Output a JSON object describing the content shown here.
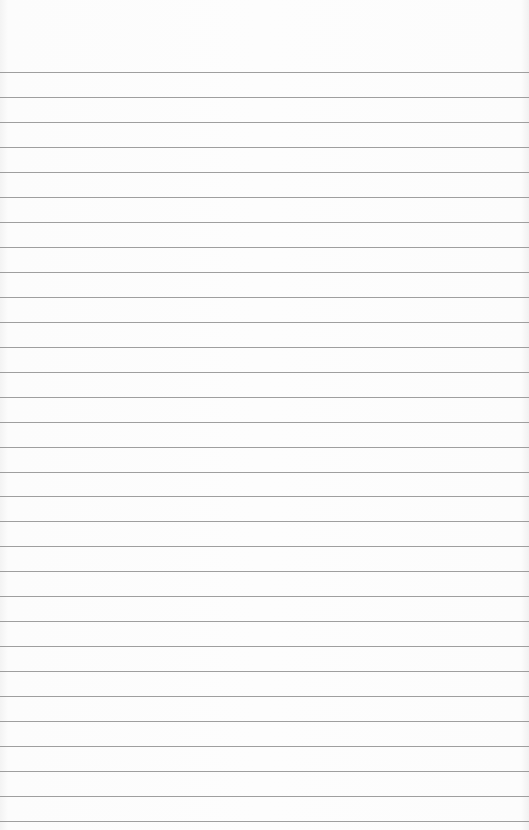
{
  "page": {
    "type": "lined-paper",
    "background_color": "#fbfbfb",
    "rule_color": "#8e8e8e",
    "first_rule_y": 72,
    "rule_spacing": 24.97,
    "rule_count": 31,
    "text": ""
  }
}
